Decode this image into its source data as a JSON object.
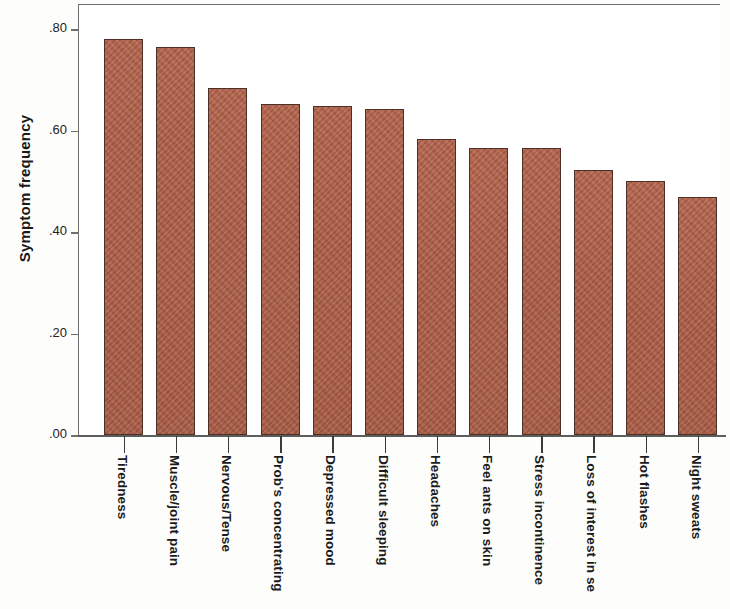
{
  "chart_data": {
    "type": "bar",
    "title": "",
    "xlabel": "",
    "ylabel": "Symptom frequency",
    "ylim": [
      0.0,
      0.85
    ],
    "ytick_labels": [
      ".00",
      ".20",
      ".40",
      ".60",
      ".80"
    ],
    "ytick_values": [
      0.0,
      0.2,
      0.4,
      0.6,
      0.8
    ],
    "grid": false,
    "legend": "none",
    "bar_color": "#ab5c45",
    "bar_edge_color": "#4d3028",
    "categories": [
      "Tiredness",
      "Muscle/joint pain",
      "Nervous/Tense",
      "Prob's concentrating",
      "Depressed mood",
      "Difficult sleeping",
      "Headaches",
      "Feel ants on skin",
      "Stress incontinence",
      "Loss of interest in se",
      "Hot flashes",
      "Night sweats"
    ],
    "values": [
      0.78,
      0.765,
      0.683,
      0.652,
      0.648,
      0.642,
      0.584,
      0.565,
      0.565,
      0.522,
      0.5,
      0.468
    ]
  }
}
